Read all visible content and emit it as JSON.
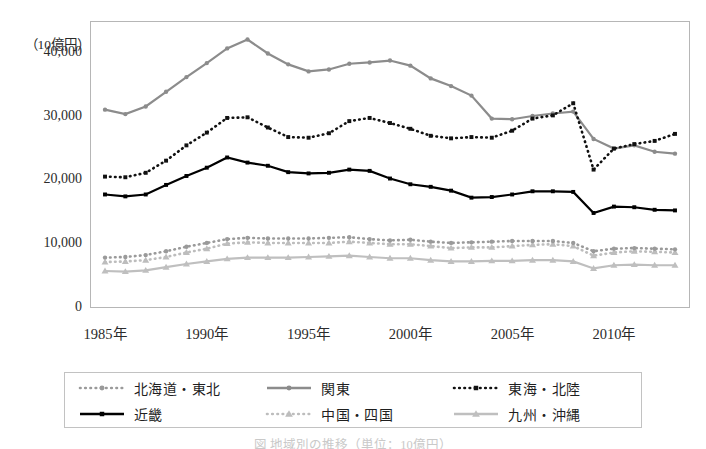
{
  "figure": {
    "unit_label": "（10億円）",
    "caption": "図 地域別の推移（単位：10億円）"
  },
  "axes": {
    "y_ticks": [
      "40,000",
      "30,000",
      "20,000",
      "10,000",
      "0"
    ],
    "y_tick_values": [
      40000,
      30000,
      20000,
      10000,
      0
    ],
    "x_ticks": [
      "1985年",
      "1990年",
      "1995年",
      "2000年",
      "2005年",
      "2010年"
    ],
    "x_tick_values": [
      1985,
      1990,
      1995,
      2000,
      2005,
      2010
    ]
  },
  "legend": {
    "items": [
      {
        "label": "北海道・東北",
        "key": "hokkaido_tohoku"
      },
      {
        "label": "関東",
        "key": "kanto"
      },
      {
        "label": "東海・北陸",
        "key": "tokai_hokuriku"
      },
      {
        "label": "近畿",
        "key": "kinki"
      },
      {
        "label": "中国・四国",
        "key": "chugoku_shikoku"
      },
      {
        "label": "九州・沖縄",
        "key": "kyushu_okinawa"
      }
    ]
  },
  "chart_data": {
    "type": "line",
    "title": "",
    "xlabel": "",
    "ylabel": "（10億円）",
    "xlim": [
      1985,
      2013
    ],
    "ylim": [
      0,
      45000
    ],
    "grid": false,
    "legend_position": "bottom",
    "x": [
      1985,
      1986,
      1987,
      1988,
      1989,
      1990,
      1991,
      1992,
      1993,
      1994,
      1995,
      1996,
      1997,
      1998,
      1999,
      2000,
      2001,
      2002,
      2003,
      2004,
      2005,
      2006,
      2007,
      2008,
      2009,
      2010,
      2011,
      2012,
      2013
    ],
    "series": [
      {
        "name": "北海道・東北",
        "color": "#9a9a9a",
        "marker": "circle",
        "line": "dotted",
        "values": [
          7900,
          8000,
          8300,
          8900,
          9600,
          10200,
          10800,
          11000,
          10900,
          10900,
          10900,
          11000,
          11100,
          10800,
          10600,
          10700,
          10400,
          10200,
          10300,
          10400,
          10500,
          10500,
          10500,
          10200,
          8900,
          9300,
          9400,
          9300,
          9200
        ]
      },
      {
        "name": "関東",
        "color": "#8c8c8c",
        "marker": "circle",
        "line": "solid",
        "values": [
          31100,
          30400,
          31600,
          33900,
          36200,
          38400,
          40700,
          42100,
          39900,
          38200,
          37100,
          37400,
          38300,
          38500,
          38800,
          38000,
          36000,
          34800,
          33300,
          29700,
          29600,
          30100,
          30500,
          30800,
          26500,
          25000,
          25500,
          24500,
          24200
        ]
      },
      {
        "name": "東海・北陸",
        "color": "#111111",
        "marker": "square",
        "line": "dotted",
        "values": [
          20600,
          20500,
          21200,
          23100,
          25500,
          27500,
          29800,
          29900,
          28300,
          26800,
          26700,
          27400,
          29300,
          29800,
          29000,
          28100,
          27000,
          26600,
          26800,
          26700,
          27800,
          29700,
          30200,
          32100,
          21700,
          25000,
          25700,
          26200,
          27300
        ]
      },
      {
        "name": "近畿",
        "color": "#000000",
        "marker": "square",
        "line": "solid",
        "values": [
          17800,
          17500,
          17800,
          19300,
          20700,
          22000,
          23600,
          22800,
          22300,
          21300,
          21100,
          21200,
          21700,
          21500,
          20300,
          19400,
          19000,
          18400,
          17300,
          17400,
          17800,
          18300,
          18300,
          18200,
          14900,
          15900,
          15800,
          15400,
          15300
        ]
      },
      {
        "name": "中国・四国",
        "color": "#bdbdbd",
        "marker": "triangle",
        "line": "dotted",
        "values": [
          7200,
          7300,
          7500,
          8000,
          8700,
          9300,
          10100,
          10300,
          10200,
          10200,
          10200,
          10200,
          10400,
          10200,
          10000,
          10000,
          9700,
          9400,
          9500,
          9500,
          9700,
          9900,
          10000,
          9700,
          8200,
          8700,
          8900,
          8800,
          8700
        ]
      },
      {
        "name": "九州・沖縄",
        "color": "#bfbfbf",
        "marker": "triangle",
        "line": "solid",
        "values": [
          5800,
          5700,
          5900,
          6400,
          6900,
          7300,
          7700,
          7900,
          7900,
          7900,
          8000,
          8100,
          8200,
          8000,
          7800,
          7800,
          7500,
          7300,
          7300,
          7400,
          7400,
          7500,
          7500,
          7300,
          6200,
          6700,
          6800,
          6700,
          6700
        ]
      }
    ]
  }
}
